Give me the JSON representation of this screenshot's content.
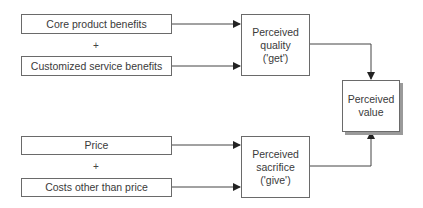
{
  "diagram": {
    "inputs_get": [
      {
        "label": "Core product benefits"
      },
      {
        "label": "Customized service benefits"
      }
    ],
    "inputs_give": [
      {
        "label": "Price"
      },
      {
        "label": "Costs other than price"
      }
    ],
    "operator": "+",
    "quality": {
      "label": "Perceived\nquality\n('get')"
    },
    "sacrifice": {
      "label": "Perceived\nsacrifice\n('give')"
    },
    "value": {
      "label": "Perceived\nvalue"
    },
    "colors": {
      "line": "#333333",
      "border": "#6a6a6a",
      "shadow": "#9a9a9a"
    }
  }
}
